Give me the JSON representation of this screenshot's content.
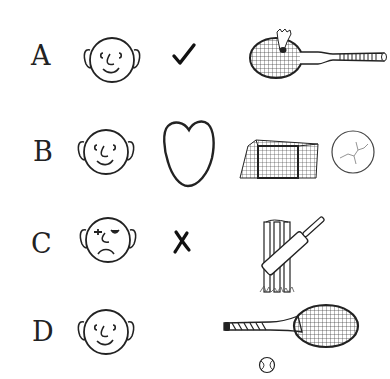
{
  "rows": [
    {
      "letter": "A",
      "face": "smiling-face",
      "symbol": "check-mark",
      "sport": "badminton-racket-shuttlecock"
    },
    {
      "letter": "B",
      "face": "smiling-face",
      "symbol": "heart",
      "sport": "football-goal-ball"
    },
    {
      "letter": "C",
      "face": "sad-face",
      "symbol": "cross-mark",
      "sport": "cricket-bat-stumps"
    },
    {
      "letter": "D",
      "face": "smiling-face",
      "symbol": "",
      "sport": "tennis-racket-ball"
    }
  ],
  "colors": {
    "ink": "#222222",
    "background": "#ffffff"
  }
}
